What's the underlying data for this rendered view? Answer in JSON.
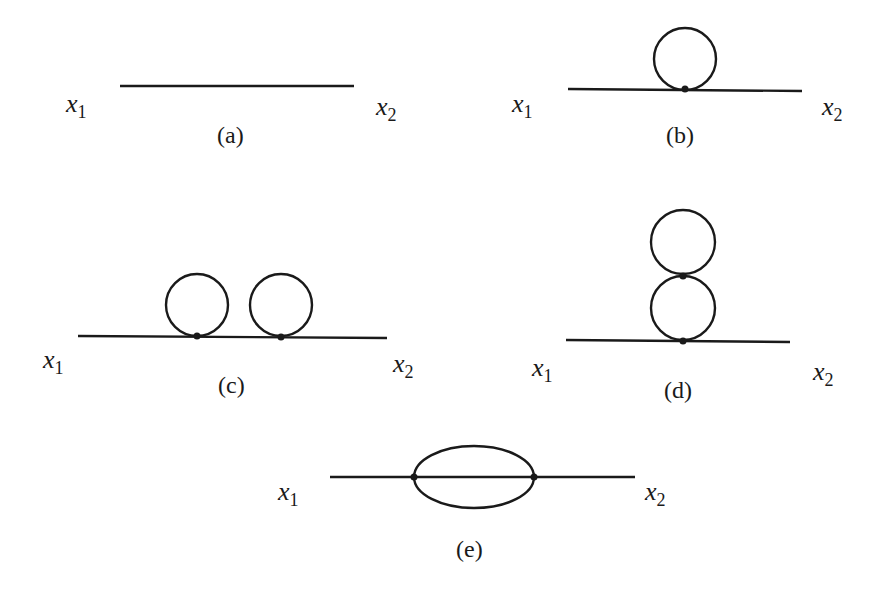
{
  "figure": {
    "panels": [
      {
        "id": "a",
        "caption": "(a)",
        "x1_label": "x",
        "x1_sub": "1",
        "x2_label": "x",
        "x2_sub": "2",
        "description": "free propagator"
      },
      {
        "id": "b",
        "caption": "(b)",
        "x1_label": "x",
        "x1_sub": "1",
        "x2_label": "x",
        "x2_sub": "2",
        "description": "one tadpole loop"
      },
      {
        "id": "c",
        "caption": "(c)",
        "x1_label": "x",
        "x1_sub": "1",
        "x2_label": "x",
        "x2_sub": "2",
        "description": "two tadpole loops"
      },
      {
        "id": "d",
        "caption": "(d)",
        "x1_label": "x",
        "x1_sub": "1",
        "x2_label": "x",
        "x2_sub": "2",
        "description": "double-scoop tadpole"
      },
      {
        "id": "e",
        "caption": "(e)",
        "x1_label": "x",
        "x1_sub": "1",
        "x2_label": "x",
        "x2_sub": "2",
        "description": "sunset diagram"
      }
    ]
  }
}
